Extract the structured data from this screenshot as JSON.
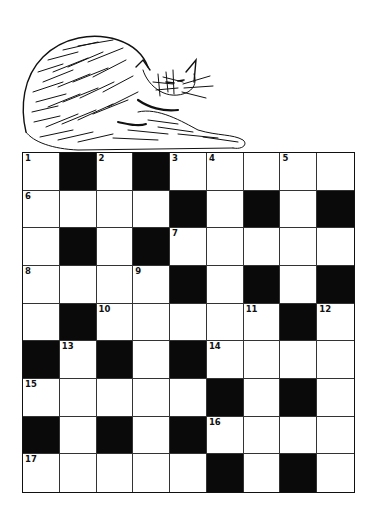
{
  "illustration": {
    "subject": "cat-grooming-drawing",
    "style": "ink-sketch"
  },
  "puzzle": {
    "type": "crossword",
    "rows": 9,
    "cols": 9,
    "colors": {
      "block": "#0a0a0a",
      "cell": "#ffffff",
      "line": "#333333"
    },
    "grid": [
      [
        "1",
        "#",
        "2",
        "#",
        "3",
        "4",
        ".",
        "5",
        "."
      ],
      [
        "6",
        ".",
        ".",
        ".",
        "#",
        ".",
        "#",
        ".",
        "#"
      ],
      [
        ".",
        "#",
        ".",
        "#",
        "7",
        ".",
        ".",
        ".",
        "."
      ],
      [
        "8",
        ".",
        ".",
        "9",
        "#",
        ".",
        "#",
        ".",
        "#"
      ],
      [
        ".",
        "#",
        "10",
        ".",
        ".",
        ".",
        "11",
        "#",
        "12"
      ],
      [
        "#",
        "13",
        "#",
        ".",
        "#",
        "14",
        ".",
        ".",
        "."
      ],
      [
        "15",
        ".",
        ".",
        ".",
        ".",
        "#",
        ".",
        "#",
        "."
      ],
      [
        "#",
        ".",
        "#",
        ".",
        "#",
        "16",
        ".",
        ".",
        "."
      ],
      [
        "17",
        ".",
        ".",
        ".",
        ".",
        "#",
        ".",
        "#",
        "."
      ]
    ],
    "clue_numbers": [
      "1",
      "2",
      "3",
      "4",
      "5",
      "6",
      "7",
      "8",
      "9",
      "10",
      "11",
      "12",
      "13",
      "14",
      "15",
      "16",
      "17"
    ]
  }
}
